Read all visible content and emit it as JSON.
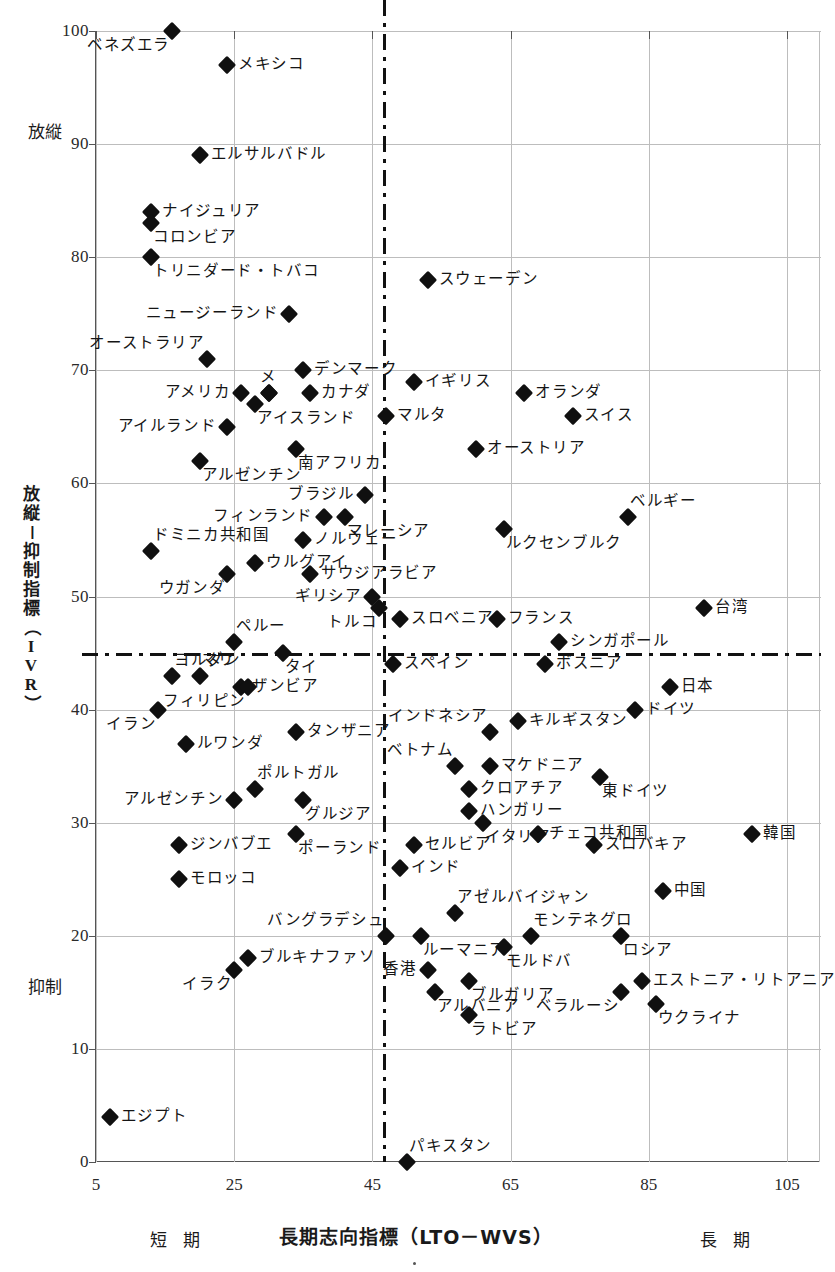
{
  "chart_data": {
    "type": "scatter",
    "title": "",
    "xlabel": "長期志向指標（LTO－WVS）",
    "ylabel": "放縦－抑制指標（IVR）",
    "xlim": [
      5,
      105
    ],
    "ylim": [
      0,
      100
    ],
    "xticks": [
      5,
      25,
      45,
      65,
      85,
      105
    ],
    "yticks": [
      0,
      10,
      20,
      30,
      40,
      50,
      60,
      70,
      80,
      90,
      100
    ],
    "grid": true,
    "legend": "none",
    "x_axis_low_label": "短 期",
    "x_axis_high_label": "長 期",
    "y_axis_high_label": "放縦",
    "y_axis_low_label": "抑制",
    "reference_lines": {
      "vertical_x": 47,
      "horizontal_y": 45,
      "style": "dash-dot"
    },
    "points": [
      {
        "name": "ベネズエラ",
        "x": 16,
        "y": 100,
        "side": "below-left"
      },
      {
        "name": "メキシコ",
        "x": 24,
        "y": 97,
        "side": "right"
      },
      {
        "name": "エルサルバドル",
        "x": 20,
        "y": 89,
        "side": "right"
      },
      {
        "name": "ナイジュリア",
        "x": 13,
        "y": 84,
        "side": "right"
      },
      {
        "name": "コロンビア",
        "x": 13,
        "y": 83,
        "side": "below-right"
      },
      {
        "name": "トリニダード・トバコ",
        "x": 13,
        "y": 80,
        "side": "below-right"
      },
      {
        "name": "ニュージーランド",
        "x": 33,
        "y": 75,
        "side": "left"
      },
      {
        "name": "オーストラリア",
        "x": 21,
        "y": 71,
        "side": "above-left"
      },
      {
        "name": "スウェーデン",
        "x": 53,
        "y": 78,
        "side": "right"
      },
      {
        "name": "デンマーク",
        "x": 35,
        "y": 70,
        "side": "right"
      },
      {
        "name": "イギリス",
        "x": 51,
        "y": 69,
        "side": "right"
      },
      {
        "name": "オランダ",
        "x": 67,
        "y": 68,
        "side": "right"
      },
      {
        "name": "アメリカ",
        "x": 26,
        "y": 68,
        "side": "left"
      },
      {
        "name": "カナダ",
        "x": 36,
        "y": 68,
        "side": "right"
      },
      {
        "name": "メ",
        "x": 30,
        "y": 68,
        "side": "above"
      },
      {
        "name": "ン",
        "x": 30,
        "y": 68,
        "side": "none"
      },
      {
        "name": "アイスランド",
        "x": 28,
        "y": 67,
        "side": "below-right"
      },
      {
        "name": "マルタ",
        "x": 47,
        "y": 66,
        "side": "right"
      },
      {
        "name": "スイス",
        "x": 74,
        "y": 66,
        "side": "right"
      },
      {
        "name": "アイルランド",
        "x": 24,
        "y": 65,
        "side": "left"
      },
      {
        "name": "南アフリカ",
        "x": 34,
        "y": 63,
        "side": "below-right"
      },
      {
        "name": "オーストリア",
        "x": 60,
        "y": 63,
        "side": "right"
      },
      {
        "name": "アルゼンチン",
        "x": 20,
        "y": 62,
        "side": "below-right"
      },
      {
        "name": "ブラジル",
        "x": 44,
        "y": 59,
        "side": "left"
      },
      {
        "name": "フィンランド",
        "x": 38,
        "y": 57,
        "side": "left"
      },
      {
        "name": "マレーシア",
        "x": 41,
        "y": 57,
        "side": "below-right"
      },
      {
        "name": "ベルギー",
        "x": 82,
        "y": 57,
        "side": "above-right"
      },
      {
        "name": "ルクセンブルク",
        "x": 64,
        "y": 56,
        "side": "below-right"
      },
      {
        "name": "ノルウェー",
        "x": 35,
        "y": 55,
        "side": "right"
      },
      {
        "name": "ドミニカ共和国",
        "x": 13,
        "y": 54,
        "side": "above-right"
      },
      {
        "name": "ウルグアイ",
        "x": 28,
        "y": 53,
        "side": "right"
      },
      {
        "name": "サウジアラビア",
        "x": 36,
        "y": 52,
        "side": "right"
      },
      {
        "name": "ウガンダ",
        "x": 24,
        "y": 52,
        "side": "below-left"
      },
      {
        "name": "ギリシア",
        "x": 45,
        "y": 50,
        "side": "left"
      },
      {
        "name": "トルコ",
        "x": 46,
        "y": 49,
        "side": "below-left"
      },
      {
        "name": "台湾",
        "x": 93,
        "y": 49,
        "side": "right"
      },
      {
        "name": "スロベニア",
        "x": 49,
        "y": 48,
        "side": "right"
      },
      {
        "name": "フランス",
        "x": 63,
        "y": 48,
        "side": "right"
      },
      {
        "name": "ペルー",
        "x": 25,
        "y": 46,
        "side": "above-right"
      },
      {
        "name": "シンガポール",
        "x": 72,
        "y": 46,
        "side": "right"
      },
      {
        "name": "タイ",
        "x": 32,
        "y": 45,
        "side": "below-right"
      },
      {
        "name": "スペイン",
        "x": 48,
        "y": 44,
        "side": "right"
      },
      {
        "name": "ボスニア",
        "x": 70,
        "y": 44,
        "side": "right"
      },
      {
        "name": "ヨルダン",
        "x": 16,
        "y": 43,
        "side": "above-right"
      },
      {
        "name": "マリ",
        "x": 20,
        "y": 43,
        "side": "above-right"
      },
      {
        "name": "ザンビア",
        "x": 26,
        "y": 42,
        "side": "right"
      },
      {
        "name": "フィリピン",
        "x": 27,
        "y": 42,
        "side": "below-left"
      },
      {
        "name": "日本",
        "x": 88,
        "y": 42,
        "side": "right"
      },
      {
        "name": "イラン",
        "x": 14,
        "y": 40,
        "side": "below-left"
      },
      {
        "name": "ドイツ",
        "x": 83,
        "y": 40,
        "side": "right"
      },
      {
        "name": "キルギスタン",
        "x": 66,
        "y": 39,
        "side": "right"
      },
      {
        "name": "タンザニア",
        "x": 34,
        "y": 38,
        "side": "right"
      },
      {
        "name": "インドネシア",
        "x": 62,
        "y": 38,
        "side": "above-left"
      },
      {
        "name": "ルワンダ",
        "x": 18,
        "y": 37,
        "side": "right"
      },
      {
        "name": "ベトナム",
        "x": 57,
        "y": 35,
        "side": "above-left"
      },
      {
        "name": "マケドニア",
        "x": 62,
        "y": 35,
        "side": "right"
      },
      {
        "name": "東ドイツ",
        "x": 78,
        "y": 34,
        "side": "below-right"
      },
      {
        "name": "ポルトガル",
        "x": 28,
        "y": 33,
        "side": "above-right"
      },
      {
        "name": "クロアチア",
        "x": 59,
        "y": 33,
        "side": "right"
      },
      {
        "name": "アルゼンチン",
        "x": 25,
        "y": 32,
        "side": "left"
      },
      {
        "name": "グルジア",
        "x": 35,
        "y": 32,
        "side": "below-right"
      },
      {
        "name": "ハンガリー",
        "x": 59,
        "y": 31,
        "side": "right"
      },
      {
        "name": "イタリア",
        "x": 61,
        "y": 30,
        "side": "below-right"
      },
      {
        "name": "チェコ共和国",
        "x": 69,
        "y": 29,
        "side": "right"
      },
      {
        "name": "ポーランド",
        "x": 34,
        "y": 29,
        "side": "below-right"
      },
      {
        "name": "ジンバブエ",
        "x": 17,
        "y": 28,
        "side": "right"
      },
      {
        "name": "セルビア",
        "x": 51,
        "y": 28,
        "side": "right"
      },
      {
        "name": "韓国",
        "x": 100,
        "y": 29,
        "side": "right"
      },
      {
        "name": "スロバキア",
        "x": 77,
        "y": 28,
        "side": "right"
      },
      {
        "name": "インド",
        "x": 49,
        "y": 26,
        "side": "right"
      },
      {
        "name": "モロッコ",
        "x": 17,
        "y": 25,
        "side": "right"
      },
      {
        "name": "中国",
        "x": 87,
        "y": 24,
        "side": "right"
      },
      {
        "name": "アゼルバイジャン",
        "x": 57,
        "y": 22,
        "side": "above-right"
      },
      {
        "name": "バングラデシュ",
        "x": 47,
        "y": 20,
        "side": "above-left"
      },
      {
        "name": "ルーマニア",
        "x": 52,
        "y": 20,
        "side": "below-right"
      },
      {
        "name": "モンテネグロ",
        "x": 68,
        "y": 20,
        "side": "above-right"
      },
      {
        "name": "ロシア",
        "x": 81,
        "y": 20,
        "side": "below-right"
      },
      {
        "name": "ブルキナファソ",
        "x": 27,
        "y": 18,
        "side": "right"
      },
      {
        "name": "モルドバ",
        "x": 64,
        "y": 19,
        "side": "below-right"
      },
      {
        "name": "イラク",
        "x": 25,
        "y": 17,
        "side": "below-left"
      },
      {
        "name": "香港",
        "x": 53,
        "y": 17,
        "side": "left"
      },
      {
        "name": "エストニア・リトアニア",
        "x": 84,
        "y": 16,
        "side": "right"
      },
      {
        "name": "ブルガリア",
        "x": 59,
        "y": 16,
        "side": "below-right"
      },
      {
        "name": "アルバニア",
        "x": 54,
        "y": 15,
        "side": "below-right"
      },
      {
        "name": "ベラルーシ",
        "x": 81,
        "y": 15,
        "side": "below-left"
      },
      {
        "name": "ウクライナ",
        "x": 86,
        "y": 14,
        "side": "below-right"
      },
      {
        "name": "ラトビア",
        "x": 59,
        "y": 13,
        "side": "below-right"
      },
      {
        "name": "エジプト",
        "x": 7,
        "y": 4,
        "side": "right"
      },
      {
        "name": "パキスタン",
        "x": 50,
        "y": 0,
        "side": "above-right"
      }
    ]
  }
}
